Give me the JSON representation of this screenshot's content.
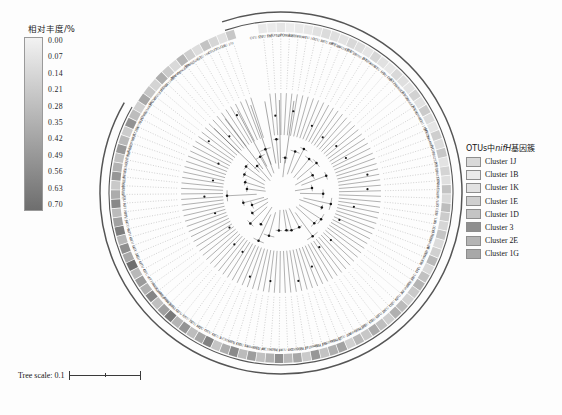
{
  "colorbar": {
    "title": "相对丰度/%",
    "ticks": [
      "0.00",
      "0.07",
      "0.14",
      "0.21",
      "0.28",
      "0.35",
      "0.42",
      "0.49",
      "0.56",
      "0.63",
      "0.70"
    ],
    "color_low": "#f2f2f2",
    "color_high": "#6e6e6e"
  },
  "cluster_legend": {
    "title_prefix": "OTUs中",
    "title_italic": "nifH",
    "title_suffix": "基因簇",
    "items": [
      {
        "label": "Cluster 1J",
        "color": "#d9d9d9"
      },
      {
        "label": "Cluster 1B",
        "color": "#eaeaea"
      },
      {
        "label": "Cluster 1K",
        "color": "#e2e2e2"
      },
      {
        "label": "Cluster 1E",
        "color": "#cfcfcf"
      },
      {
        "label": "Cluster 1D",
        "color": "#c4c4c4"
      },
      {
        "label": "Cluster 3",
        "color": "#8f8f8f"
      },
      {
        "label": "Cluster 2E",
        "color": "#b4b4b4"
      },
      {
        "label": "Cluster 1G",
        "color": "#a8a8a8"
      }
    ]
  },
  "tree_scale": {
    "label": "Tree scale: 0.1"
  },
  "chart_data": {
    "type": "tree",
    "title": "",
    "layout": "circular-radial",
    "scale_bar": 0.1,
    "ring_colormap": {
      "label": "相对丰度/%",
      "min": 0.0,
      "max": 0.7,
      "low_color": "#f2f2f2",
      "high_color": "#6e6e6e"
    },
    "clade_groups": [
      "Cluster 1J",
      "Cluster 1B",
      "Cluster 1K",
      "Cluster 1E",
      "Cluster 1D",
      "Cluster 3",
      "Cluster 2E",
      "Cluster 1G"
    ],
    "tips": [
      {
        "label": "OTU 121",
        "abundance": 0.05,
        "cluster": "Cluster 1J"
      },
      {
        "label": "OTU 186",
        "abundance": 0.04,
        "cluster": "Cluster 1J"
      },
      {
        "label": "OTU 140",
        "abundance": 0.07,
        "cluster": "Cluster 1J"
      },
      {
        "label": "KY123171.1",
        "abundance": 0.03,
        "cluster": "Cluster 1J"
      },
      {
        "label": "PQ064480.1",
        "abundance": 0.05,
        "cluster": "Cluster 1J"
      },
      {
        "label": "KY704804.1",
        "abundance": 0.06,
        "cluster": "Cluster 1J"
      },
      {
        "label": "OTU 111",
        "abundance": 0.09,
        "cluster": "Cluster 1B"
      },
      {
        "label": "OTU 39",
        "abundance": 0.12,
        "cluster": "Cluster 1B"
      },
      {
        "label": "OTU 30",
        "abundance": 0.1,
        "cluster": "Cluster 1B"
      },
      {
        "label": "OTU 69",
        "abundance": 0.08,
        "cluster": "Cluster 1B"
      },
      {
        "label": "KY110110.1",
        "abundance": 0.14,
        "cluster": "Cluster 1B"
      },
      {
        "label": "OTU 13",
        "abundance": 0.11,
        "cluster": "Cluster 1B"
      },
      {
        "label": "KX719000.1",
        "abundance": 0.07,
        "cluster": "Cluster 1B"
      },
      {
        "label": "OTU 4",
        "abundance": 0.15,
        "cluster": "Cluster 1B"
      },
      {
        "label": "KY704808.1",
        "abundance": 0.09,
        "cluster": "Cluster 1B"
      },
      {
        "label": "OTU 119",
        "abundance": 0.06,
        "cluster": "Cluster 1B"
      },
      {
        "label": "OTU 110",
        "abundance": 0.13,
        "cluster": "Cluster 1B"
      },
      {
        "label": "OTU 112",
        "abundance": 0.1,
        "cluster": "Cluster 1B"
      },
      {
        "label": "KY704806.1",
        "abundance": 0.08,
        "cluster": "Cluster 1B"
      },
      {
        "label": "OTU 38",
        "abundance": 0.17,
        "cluster": "Cluster 1K"
      },
      {
        "label": "KY219002.1",
        "abundance": 0.09,
        "cluster": "Cluster 1K"
      },
      {
        "label": "OTU 21",
        "abundance": 0.21,
        "cluster": "Cluster 1K"
      },
      {
        "label": "KX163048.1",
        "abundance": 0.12,
        "cluster": "Cluster 1K"
      },
      {
        "label": "OTU 172",
        "abundance": 0.07,
        "cluster": "Cluster 1K"
      },
      {
        "label": "OTU 26",
        "abundance": 0.19,
        "cluster": "Cluster 1K"
      },
      {
        "label": "MN294649.1",
        "abundance": 0.11,
        "cluster": "Cluster 1K"
      },
      {
        "label": "OTU 11",
        "abundance": 0.23,
        "cluster": "Cluster 1K"
      },
      {
        "label": "KC355621.1",
        "abundance": 0.08,
        "cluster": "Cluster 1K"
      },
      {
        "label": "OTU 20",
        "abundance": 0.16,
        "cluster": "Cluster 1K"
      },
      {
        "label": "KY110612.1",
        "abundance": 0.1,
        "cluster": "Cluster 1K"
      },
      {
        "label": "OTU 17",
        "abundance": 0.25,
        "cluster": "Cluster 1K"
      },
      {
        "label": "AB825069.1",
        "abundance": 0.13,
        "cluster": "Cluster 1E"
      },
      {
        "label": "OTU 60",
        "abundance": 0.28,
        "cluster": "Cluster 1E"
      },
      {
        "label": "OTU 32",
        "abundance": 0.2,
        "cluster": "Cluster 1E"
      },
      {
        "label": "OTU 161",
        "abundance": 0.15,
        "cluster": "Cluster 1E"
      },
      {
        "label": "OTU 70",
        "abundance": 0.24,
        "cluster": "Cluster 1E"
      },
      {
        "label": "U80118.2",
        "abundance": 0.12,
        "cluster": "Cluster 1E"
      },
      {
        "label": "AB189120.1",
        "abundance": 0.18,
        "cluster": "Cluster 1E"
      },
      {
        "label": "OTU 80",
        "abundance": 0.3,
        "cluster": "Cluster 1E"
      },
      {
        "label": "MN394807.1",
        "abundance": 0.14,
        "cluster": "Cluster 1E"
      },
      {
        "label": "OTU 163",
        "abundance": 0.26,
        "cluster": "Cluster 1E"
      },
      {
        "label": "OTU 171",
        "abundance": 0.33,
        "cluster": "Cluster 1D"
      },
      {
        "label": "OTU 50",
        "abundance": 0.22,
        "cluster": "Cluster 1D"
      },
      {
        "label": "KF182007.1",
        "abundance": 0.17,
        "cluster": "Cluster 1D"
      },
      {
        "label": "OTU 36",
        "abundance": 0.29,
        "cluster": "Cluster 1D"
      },
      {
        "label": "OTU 82",
        "abundance": 0.35,
        "cluster": "Cluster 1D"
      },
      {
        "label": "OTU 132",
        "abundance": 0.19,
        "cluster": "Cluster 1D"
      },
      {
        "label": "OTU 29",
        "abundance": 0.27,
        "cluster": "Cluster 1D"
      },
      {
        "label": "OTU 59",
        "abundance": 0.38,
        "cluster": "Cluster 1D"
      },
      {
        "label": "OTU 156",
        "abundance": 0.23,
        "cluster": "Cluster 1D"
      },
      {
        "label": "OTU 208",
        "abundance": 0.31,
        "cluster": "Cluster 3"
      },
      {
        "label": "AM419394.1",
        "abundance": 0.18,
        "cluster": "Cluster 3"
      },
      {
        "label": "OTU 124",
        "abundance": 0.42,
        "cluster": "Cluster 3"
      },
      {
        "label": "OTU 62",
        "abundance": 0.36,
        "cluster": "Cluster 3"
      },
      {
        "label": "MK038004.1",
        "abundance": 0.25,
        "cluster": "Cluster 3"
      },
      {
        "label": "OTU 13b",
        "abundance": 0.48,
        "cluster": "Cluster 3"
      },
      {
        "label": "HQ994864.1",
        "abundance": 0.21,
        "cluster": "Cluster 3"
      },
      {
        "label": "OTU 27",
        "abundance": 0.4,
        "cluster": "Cluster 3"
      },
      {
        "label": "GQ503688.1",
        "abundance": 0.3,
        "cluster": "Cluster 3"
      },
      {
        "label": "OTU 197",
        "abundance": 0.52,
        "cluster": "Cluster 2E"
      },
      {
        "label": "OTU 24",
        "abundance": 0.34,
        "cluster": "Cluster 2E"
      },
      {
        "label": "KC196704.1",
        "abundance": 0.26,
        "cluster": "Cluster 2E"
      },
      {
        "label": "OTU 48",
        "abundance": 0.45,
        "cluster": "Cluster 2E"
      },
      {
        "label": "FR848082.1",
        "abundance": 0.29,
        "cluster": "Cluster 2E"
      },
      {
        "label": "OTU 54",
        "abundance": 0.55,
        "cluster": "Cluster 2E"
      },
      {
        "label": "OTU 130",
        "abundance": 0.37,
        "cluster": "Cluster 2E"
      },
      {
        "label": "KC826070.1",
        "abundance": 0.24,
        "cluster": "Cluster 2E"
      },
      {
        "label": "OTU 5",
        "abundance": 0.6,
        "cluster": "Cluster 2E"
      },
      {
        "label": "OTU 44",
        "abundance": 0.41,
        "cluster": "Cluster 2E"
      },
      {
        "label": "OTU 77",
        "abundance": 0.28,
        "cluster": "Cluster 2E"
      },
      {
        "label": "OTU 182",
        "abundance": 0.5,
        "cluster": "Cluster 2E"
      },
      {
        "label": "OTU 74",
        "abundance": 0.33,
        "cluster": "Cluster 1G"
      },
      {
        "label": "OTU 57",
        "abundance": 0.64,
        "cluster": "Cluster 1G"
      },
      {
        "label": "OTU 18",
        "abundance": 0.44,
        "cluster": "Cluster 1G"
      },
      {
        "label": "FJ007816.1",
        "abundance": 0.27,
        "cluster": "Cluster 1G"
      },
      {
        "label": "AB054964.1",
        "abundance": 0.58,
        "cluster": "Cluster 1G"
      },
      {
        "label": "KC826065.1",
        "abundance": 0.35,
        "cluster": "Cluster 1G"
      },
      {
        "label": "AY196036.1",
        "abundance": 0.46,
        "cluster": "Cluster 1G"
      },
      {
        "label": "OTU 6",
        "abundance": 0.31,
        "cluster": "Cluster 1G"
      },
      {
        "label": "OTU 45",
        "abundance": 0.7,
        "cluster": "Cluster 1G"
      },
      {
        "label": "OTU 61",
        "abundance": 0.39,
        "cluster": "Cluster 1G"
      },
      {
        "label": "OTU 24b",
        "abundance": 0.53,
        "cluster": "Cluster 1G"
      },
      {
        "label": "OTU 56",
        "abundance": 0.32,
        "cluster": "Cluster 1G"
      },
      {
        "label": "OTU 46",
        "abundance": 0.62,
        "cluster": "Cluster 1G"
      },
      {
        "label": "OTU 96",
        "abundance": 0.43,
        "cluster": "Cluster 1J"
      },
      {
        "label": "OTU 94",
        "abundance": 0.29,
        "cluster": "Cluster 1J"
      },
      {
        "label": "KF119071.1",
        "abundance": 0.56,
        "cluster": "Cluster 1J"
      },
      {
        "label": "OTU 16",
        "abundance": 0.37,
        "cluster": "Cluster 1J"
      },
      {
        "label": "OTU 123",
        "abundance": 0.22,
        "cluster": "Cluster 1J"
      },
      {
        "label": "AB507162.1",
        "abundance": 0.49,
        "cluster": "Cluster 1J"
      },
      {
        "label": "MK539278.1",
        "abundance": 0.34,
        "cluster": "Cluster 1J"
      },
      {
        "label": "KC356360.1",
        "abundance": 0.26,
        "cluster": "Cluster 1J"
      },
      {
        "label": "OTU 128",
        "abundance": 0.47,
        "cluster": "Cluster 1J"
      },
      {
        "label": "FJ947439.1",
        "abundance": 0.3,
        "cluster": "Cluster 1J"
      },
      {
        "label": "KX019788.2",
        "abundance": 0.2,
        "cluster": "Cluster 1J"
      },
      {
        "label": "OTU 158",
        "abundance": 0.51,
        "cluster": "Cluster 1J"
      },
      {
        "label": "KC356770.1",
        "abundance": 0.28,
        "cluster": "Cluster 1J"
      },
      {
        "label": "OTU 136",
        "abundance": 0.18,
        "cluster": "Cluster 1J"
      },
      {
        "label": "AB470340.1",
        "abundance": 0.4,
        "cluster": "Cluster 1J"
      },
      {
        "label": "OTU 47",
        "abundance": 0.24,
        "cluster": "Cluster 1J"
      },
      {
        "label": "MG369202.1",
        "abundance": 0.16,
        "cluster": "Cluster 1J"
      },
      {
        "label": "OTU 86",
        "abundance": 0.36,
        "cluster": "Cluster 1J"
      },
      {
        "label": "LT622134.1",
        "abundance": 0.21,
        "cluster": "Cluster 1J"
      },
      {
        "label": "OTU 72",
        "abundance": 0.13,
        "cluster": "Cluster 1J"
      },
      {
        "label": "MW400962.1",
        "abundance": 0.32,
        "cluster": "Cluster 1J"
      },
      {
        "label": "OTU 12",
        "abundance": 0.19,
        "cluster": "Cluster 1J"
      },
      {
        "label": "MK415282.1",
        "abundance": 0.11,
        "cluster": "Cluster 1J"
      },
      {
        "label": "OTU 104",
        "abundance": 0.25,
        "cluster": "Cluster 1J"
      },
      {
        "label": "OTU 7",
        "abundance": 0.15,
        "cluster": "Cluster 1J"
      },
      {
        "label": "OTU 14",
        "abundance": 0.09,
        "cluster": "Cluster 1J"
      },
      {
        "label": "OTU 179",
        "abundance": 0.23,
        "cluster": "Cluster 1J"
      }
    ]
  }
}
